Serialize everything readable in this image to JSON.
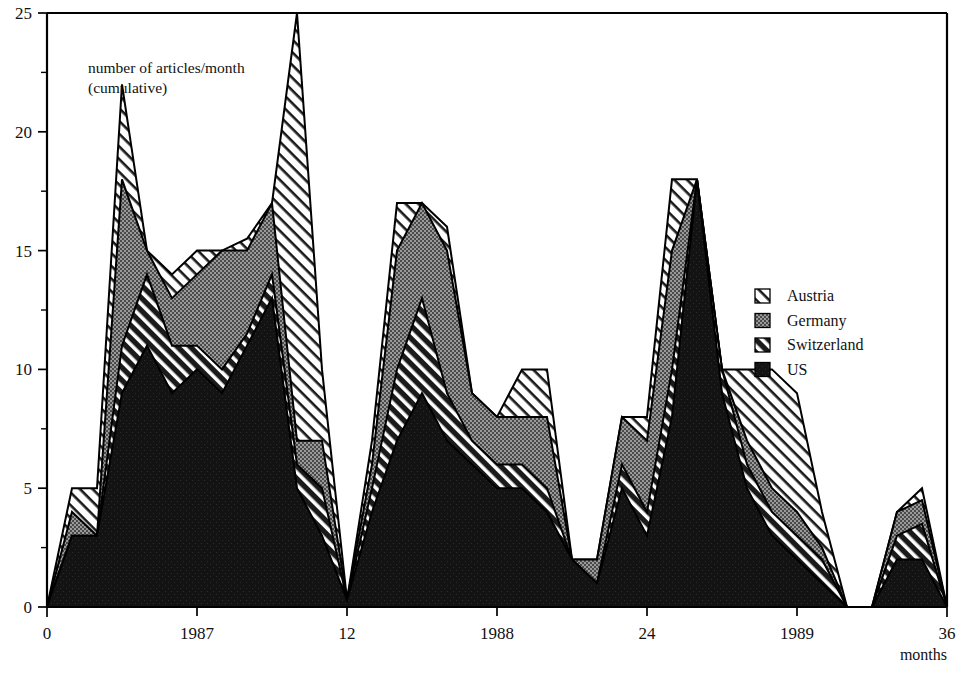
{
  "annotation": {
    "line1": "number of articles/month",
    "line2": "(cumulative)"
  },
  "axes": {
    "x_name": "months",
    "y_ticks": [
      "0",
      "5",
      "10",
      "15",
      "20",
      "25"
    ],
    "x_ticks": [
      "0",
      "1987",
      "12",
      "1988",
      "24",
      "1989",
      "36"
    ]
  },
  "legend": {
    "items": [
      {
        "label": "Austria",
        "pattern": "light-diagonal-hatch",
        "color": "#ffffff"
      },
      {
        "label": "Germany",
        "pattern": "gray-stipple",
        "color": "#8a8a8a"
      },
      {
        "label": "Switzerland",
        "pattern": "dark-diagonal-hatch",
        "color": "#555555"
      },
      {
        "label": "US",
        "pattern": "solid-black",
        "color": "#111111"
      }
    ]
  },
  "chart_data": {
    "type": "area",
    "title": "number of articles/month (cumulative)",
    "xlabel": "months",
    "ylabel": "number of articles/month (cumulative)",
    "xlim": [
      0,
      36
    ],
    "ylim": [
      0,
      25
    ],
    "xtick_values": [
      0,
      6,
      12,
      18,
      24,
      30,
      36
    ],
    "xtick_labels": [
      "0",
      "1987",
      "12",
      "1988",
      "24",
      "1989",
      "36"
    ],
    "ytick_values": [
      0,
      5,
      10,
      15,
      20,
      25
    ],
    "yminor_step": 2.5,
    "grid": false,
    "legend_position": "right",
    "stacked": true,
    "stack_order_bottom_to_top": [
      "US",
      "Switzerland",
      "Germany",
      "Austria"
    ],
    "x": [
      0,
      1,
      2,
      3,
      4,
      5,
      6,
      7,
      8,
      9,
      10,
      11,
      12,
      13,
      14,
      15,
      16,
      17,
      18,
      19,
      20,
      21,
      22,
      23,
      24,
      25,
      26,
      27,
      28,
      29,
      30,
      31,
      32,
      33,
      34,
      35,
      36
    ],
    "series": [
      {
        "name": "US",
        "values": [
          0,
          3,
          3,
          9,
          11,
          9,
          10,
          9,
          11,
          13,
          5,
          3,
          0.3,
          4,
          7,
          9,
          7,
          6,
          5,
          5,
          4,
          2,
          1,
          5,
          3,
          8,
          18,
          9,
          5,
          3,
          2,
          1,
          0,
          0,
          2,
          2,
          0
        ]
      },
      {
        "name": "Switzerland",
        "values": [
          0,
          0,
          0,
          2,
          3,
          2,
          1,
          1,
          0.5,
          1,
          1,
          2,
          0,
          1,
          3,
          4,
          2,
          1,
          1,
          1,
          1,
          0,
          0,
          1,
          1,
          2,
          0,
          1,
          1,
          1,
          1,
          1,
          0,
          0,
          1,
          1.5,
          0
        ]
      },
      {
        "name": "Germany",
        "values": [
          0,
          1,
          0,
          7,
          1,
          2,
          3,
          5,
          3.5,
          3,
          1,
          2,
          0,
          1,
          5,
          4,
          6,
          2,
          2,
          2,
          3,
          0,
          1,
          2,
          3,
          5,
          0,
          0,
          1,
          1,
          1,
          0.5,
          0,
          0,
          1,
          1,
          0
        ]
      },
      {
        "name": "Austria",
        "values": [
          0,
          1,
          2,
          4,
          0,
          1,
          1,
          0,
          0.5,
          0,
          18,
          3,
          0,
          1,
          2,
          0,
          1,
          0,
          0,
          2,
          2,
          0,
          0,
          0,
          1,
          3,
          0,
          0,
          3,
          5,
          5,
          1.5,
          0,
          0,
          0,
          0.5,
          0
        ]
      }
    ],
    "totals": [
      0,
      5,
      5,
      22,
      15,
      14,
      15,
      15,
      15,
      17,
      25,
      10,
      0.3,
      7,
      17,
      17,
      16,
      9,
      8,
      10,
      10,
      2,
      2,
      8,
      8,
      18,
      18,
      10,
      10,
      10,
      9,
      4,
      0,
      0,
      4,
      5,
      0
    ]
  }
}
